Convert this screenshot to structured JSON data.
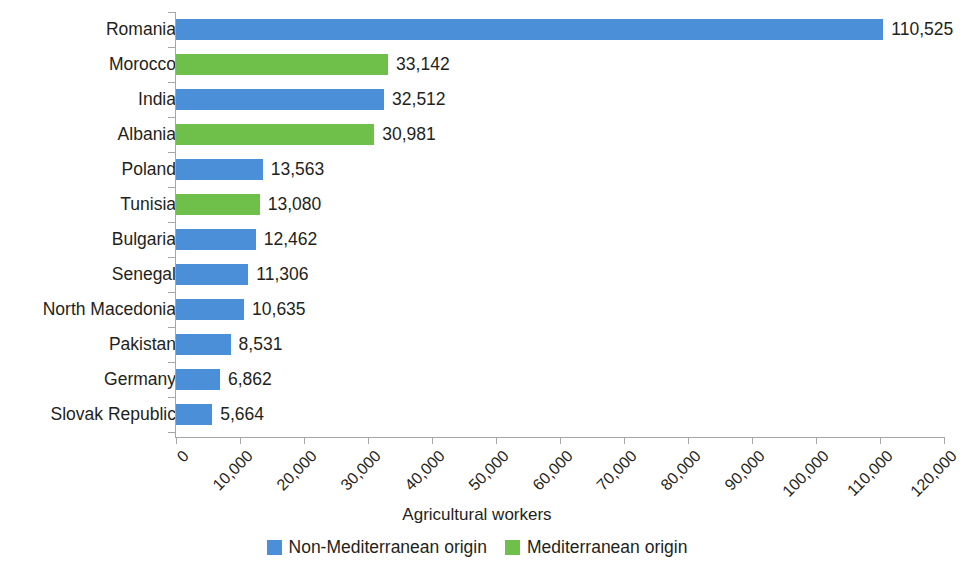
{
  "chart_data": {
    "type": "bar",
    "orientation": "horizontal",
    "title": "",
    "xlabel": "Agricultural workers",
    "ylabel": "",
    "xlim": [
      0,
      120000
    ],
    "xticks": [
      "0",
      "10,000",
      "20,000",
      "30,000",
      "40,000",
      "50,000",
      "60,000",
      "70,000",
      "80,000",
      "90,000",
      "100,000",
      "110,000",
      "120,000"
    ],
    "xtick_values": [
      0,
      10000,
      20000,
      30000,
      40000,
      50000,
      60000,
      70000,
      80000,
      90000,
      100000,
      110000,
      120000
    ],
    "grid": false,
    "legend_position": "bottom-center",
    "categories": [
      "Romania",
      "Morocco",
      "India",
      "Albania",
      "Poland",
      "Tunisia",
      "Bulgaria",
      "Senegal",
      "North Macedonia",
      "Pakistan",
      "Germany",
      "Slovak Republic"
    ],
    "values": [
      110525,
      33142,
      32512,
      30981,
      13563,
      13080,
      12462,
      11306,
      10635,
      8531,
      6862,
      5664
    ],
    "value_labels": [
      "110,525",
      "33,142",
      "32,512",
      "30,981",
      "13,563",
      "13,080",
      "12,462",
      "11,306",
      "10,635",
      "8,531",
      "6,862",
      "5,664"
    ],
    "group_of_category": [
      "non-mediterranean",
      "mediterranean",
      "non-mediterranean",
      "mediterranean",
      "non-mediterranean",
      "mediterranean",
      "non-mediterranean",
      "non-mediterranean",
      "non-mediterranean",
      "non-mediterranean",
      "non-mediterranean",
      "non-mediterranean"
    ],
    "legend": [
      {
        "key": "non-mediterranean",
        "label": "Non-Mediterranean origin",
        "color": "#4a8fd8"
      },
      {
        "key": "mediterranean",
        "label": "Mediterranean origin",
        "color": "#6fc04b"
      }
    ]
  }
}
